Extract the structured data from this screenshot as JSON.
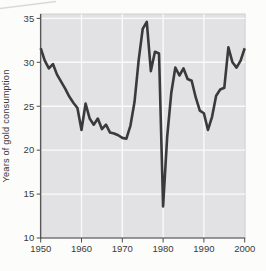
{
  "chart_data": {
    "type": "line",
    "title": "",
    "xlabel": "",
    "ylabel": "Years of gold consumption",
    "x": [
      1950,
      1951,
      1952,
      1953,
      1954,
      1955,
      1956,
      1957,
      1958,
      1959,
      1960,
      1961,
      1962,
      1963,
      1964,
      1965,
      1966,
      1967,
      1968,
      1969,
      1970,
      1971,
      1972,
      1973,
      1974,
      1975,
      1976,
      1977,
      1978,
      1979,
      1980,
      1981,
      1982,
      1983,
      1984,
      1985,
      1986,
      1987,
      1988,
      1989,
      1990,
      1991,
      1992,
      1993,
      1994,
      1995,
      1996,
      1997,
      1998,
      1999,
      2000
    ],
    "values": [
      31.6,
      30.2,
      29.3,
      29.8,
      28.6,
      27.8,
      27.0,
      26.1,
      25.4,
      24.8,
      22.3,
      25.3,
      23.6,
      22.9,
      23.6,
      22.4,
      22.9,
      22.0,
      21.9,
      21.7,
      21.4,
      21.3,
      22.8,
      25.5,
      30.2,
      33.8,
      34.6,
      29.0,
      31.2,
      31.0,
      13.6,
      21.5,
      26.5,
      29.4,
      28.5,
      29.3,
      28.1,
      27.9,
      26.0,
      24.5,
      24.2,
      22.3,
      23.8,
      26.2,
      26.9,
      27.1,
      31.7,
      30.0,
      29.4,
      30.2,
      31.6
    ],
    "xlim": [
      1950,
      2000
    ],
    "ylim": [
      10,
      35.5
    ],
    "x_ticks": [
      1950,
      1960,
      1970,
      1980,
      1990,
      2000
    ],
    "y_ticks": [
      10,
      15,
      20,
      25,
      30,
      35
    ],
    "grid": true,
    "legend": "none",
    "colors": {
      "line": "#3a3a3a",
      "plot_background": "#e2e2e4",
      "plot_border": "#c9c9cb",
      "gridline": "#fafafa",
      "axis": "#4a4a4a",
      "label": "#3a3a3a",
      "page_background": "#fcfcfb",
      "scan_artifact": "#d9d9d9"
    }
  }
}
